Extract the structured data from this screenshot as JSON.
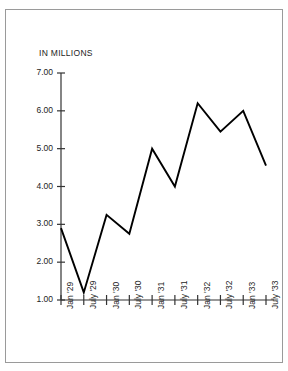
{
  "axis_note": "IN MILLIONS",
  "chart_data": {
    "type": "line",
    "title": "",
    "xlabel": "",
    "ylabel": "IN MILLIONS",
    "ylim": [
      1.0,
      7.0
    ],
    "ytick_step": 1.0,
    "grid": false,
    "legend": "none",
    "ytick_labels": [
      "7.00",
      "6.00",
      "5.00",
      "4.00",
      "3.00",
      "2.00",
      "1.00"
    ],
    "ytick_values": [
      7.0,
      6.0,
      5.0,
      4.0,
      3.0,
      2.0,
      1.0
    ],
    "categories": [
      "Jan '29",
      "July '29",
      "Jan '30",
      "July '30",
      "Jan '31",
      "July '31",
      "Jan '32",
      "July '32",
      "Jan '33",
      "July '33"
    ],
    "values": [
      2.9,
      1.2,
      3.25,
      2.75,
      5.0,
      4.0,
      6.2,
      5.45,
      6.0,
      4.55
    ],
    "line_color": "#000000",
    "axis_color": "#333333"
  }
}
